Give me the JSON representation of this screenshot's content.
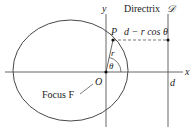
{
  "labels": {
    "y_axis": "y",
    "x_axis": "x",
    "directrix": "Directrix",
    "directrix_symbol": "𝒟",
    "point": "P",
    "distance": "d − r cos θ",
    "radius": "r",
    "angle": "θ",
    "origin": "O",
    "focus": "Focus F",
    "d_mark": "d"
  },
  "geometry": {
    "ellipse": {
      "cx": 70.5,
      "cy": 70.5,
      "rx": 57.5,
      "ry": 50.5
    },
    "origin": {
      "x": 106,
      "y": 72
    },
    "point_P": {
      "x": 113,
      "y": 40
    },
    "directrix_x": 168
  },
  "colors": {
    "stroke": "#333333",
    "line": "#555555"
  }
}
